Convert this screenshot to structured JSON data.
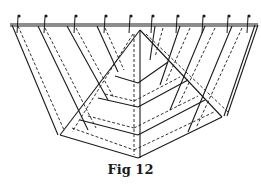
{
  "figure": {
    "caption": "Fig 12",
    "stroke_color": "#1a1a1a",
    "background": "#ffffff",
    "top_bar": {
      "x1": 10,
      "y1": 24,
      "x2": 258,
      "y2": 24
    },
    "pins_x": [
      18,
      45,
      75,
      105,
      130,
      152,
      177,
      203,
      228,
      248
    ],
    "solid_lines": [
      [
        10,
        24,
        258,
        24
      ],
      [
        10,
        26,
        258,
        26
      ],
      [
        12,
        25,
        58,
        135
      ],
      [
        38,
        26,
        88,
        130
      ],
      [
        67,
        26,
        108,
        100
      ],
      [
        97,
        26,
        118,
        72
      ],
      [
        140,
        30,
        60,
        135
      ],
      [
        140,
        30,
        140,
        158
      ],
      [
        140,
        30,
        222,
        117
      ],
      [
        60,
        135,
        138,
        158
      ],
      [
        138,
        158,
        222,
        117
      ],
      [
        255,
        25,
        224,
        116
      ],
      [
        258,
        25,
        227,
        116
      ],
      [
        232,
        26,
        188,
        132
      ],
      [
        205,
        26,
        170,
        110
      ],
      [
        180,
        26,
        160,
        85
      ],
      [
        155,
        26,
        150,
        60
      ],
      [
        80,
        120,
        138,
        135
      ],
      [
        138,
        135,
        205,
        100
      ],
      [
        98,
        98,
        138,
        107
      ],
      [
        138,
        107,
        188,
        80
      ],
      [
        115,
        76,
        138,
        83
      ],
      [
        138,
        83,
        168,
        62
      ]
    ],
    "dashed_lines": [
      [
        18,
        26,
        64,
        130
      ],
      [
        45,
        28,
        96,
        128
      ],
      [
        76,
        28,
        114,
        98
      ],
      [
        105,
        28,
        124,
        70
      ],
      [
        133,
        34,
        72,
        132
      ],
      [
        134,
        34,
        134,
        155
      ],
      [
        146,
        34,
        228,
        112
      ],
      [
        72,
        128,
        134,
        150
      ],
      [
        134,
        150,
        214,
        112
      ],
      [
        88,
        116,
        134,
        128
      ],
      [
        134,
        128,
        198,
        96
      ],
      [
        105,
        94,
        134,
        101
      ],
      [
        134,
        101,
        180,
        77
      ],
      [
        242,
        28,
        196,
        128
      ],
      [
        215,
        28,
        178,
        106
      ],
      [
        190,
        28,
        166,
        82
      ],
      [
        163,
        28,
        155,
        57
      ]
    ]
  }
}
